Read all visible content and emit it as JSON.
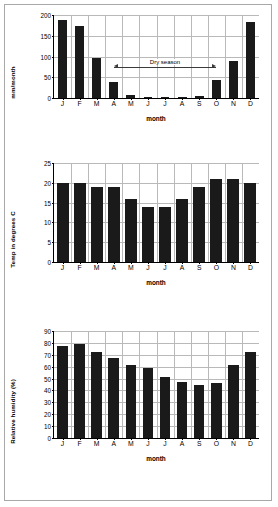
{
  "months": [
    "J",
    "F",
    "M",
    "A",
    "M",
    "J",
    "J",
    "A",
    "S",
    "O",
    "N",
    "D"
  ],
  "axis_title_x": "month",
  "annotation": {
    "dry_season_label": "Dry season"
  },
  "chart_data": [
    {
      "type": "bar",
      "title": "",
      "xlabel": "month",
      "ylabel": "mm/month",
      "categories": [
        "J",
        "F",
        "M",
        "A",
        "M",
        "J",
        "J",
        "A",
        "S",
        "O",
        "N",
        "D"
      ],
      "values": [
        187,
        173,
        96,
        39,
        8,
        2,
        2,
        3,
        6,
        43,
        90,
        183
      ],
      "ylim": [
        0,
        200
      ],
      "yticks": [
        0,
        50,
        100,
        150,
        200
      ],
      "grid": true,
      "legend": "none",
      "annotations": [
        {
          "text": "Dry season",
          "from_category": "A",
          "to_category": "O",
          "y_value": 75,
          "style": "double-arrow"
        }
      ]
    },
    {
      "type": "bar",
      "title": "",
      "xlabel": "month",
      "ylabel": "Temp in degrees C",
      "categories": [
        "J",
        "F",
        "M",
        "A",
        "M",
        "J",
        "J",
        "A",
        "S",
        "O",
        "N",
        "D"
      ],
      "values": [
        20,
        20,
        19,
        19,
        16,
        14,
        14,
        16,
        19,
        21,
        21,
        20
      ],
      "ylim": [
        0,
        25
      ],
      "yticks": [
        0,
        5,
        10,
        15,
        20,
        25
      ],
      "grid": true,
      "legend": "none"
    },
    {
      "type": "bar",
      "title": "",
      "xlabel": "month",
      "ylabel": "Relative humidity (%)",
      "categories": [
        "J",
        "F",
        "M",
        "A",
        "M",
        "J",
        "J",
        "A",
        "S",
        "O",
        "N",
        "D"
      ],
      "values": [
        77,
        79,
        72,
        67.5,
        61,
        59,
        51,
        47,
        45,
        46,
        61,
        72.5
      ],
      "ylim": [
        0,
        90
      ],
      "yticks": [
        0,
        10,
        20,
        30,
        40,
        50,
        60,
        70,
        80,
        90
      ],
      "grid": true,
      "legend": "none"
    }
  ]
}
